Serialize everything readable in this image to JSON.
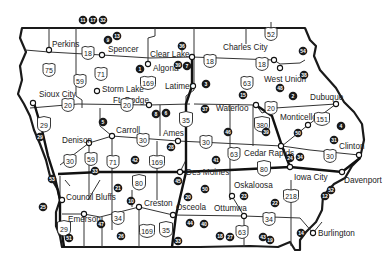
{
  "map": {
    "title": "Iowa",
    "cities": [
      {
        "name": "Perkins",
        "x": 49,
        "y": 50,
        "lx": 52,
        "ly": 47
      },
      {
        "name": "Spencer",
        "x": 102,
        "y": 55,
        "lx": 108,
        "ly": 52
      },
      {
        "name": "Clear Lake",
        "x": 192,
        "y": 57,
        "lx": 150,
        "ly": 57
      },
      {
        "name": "Algona",
        "x": 148,
        "y": 64,
        "lx": 153,
        "ly": 71
      },
      {
        "name": "Charles City",
        "x": 274,
        "y": 60,
        "lx": 223,
        "ly": 50
      },
      {
        "name": "Latimer",
        "x": 193,
        "y": 86,
        "lx": 165,
        "ly": 89
      },
      {
        "name": "West Union",
        "x": 280,
        "y": 68,
        "lx": 264,
        "ly": 82
      },
      {
        "name": "Storm Lake",
        "x": 97,
        "y": 91,
        "lx": 102,
        "ly": 92
      },
      {
        "name": "Sioux City",
        "x": 33,
        "y": 103,
        "lx": 39,
        "ly": 97
      },
      {
        "name": "Ft. Dodge",
        "x": 149,
        "y": 105,
        "lx": 113,
        "ly": 103
      },
      {
        "name": "Dubuque",
        "x": 336,
        "y": 104,
        "lx": 310,
        "ly": 100
      },
      {
        "name": "Waterloo",
        "x": 256,
        "y": 105,
        "lx": 216,
        "ly": 111
      },
      {
        "name": "Monticello",
        "x": 308,
        "y": 125,
        "lx": 280,
        "ly": 120
      },
      {
        "name": "Carroll",
        "x": 112,
        "y": 136,
        "lx": 116,
        "ly": 133
      },
      {
        "name": "Ames",
        "x": 178,
        "y": 141,
        "lx": 163,
        "ly": 136
      },
      {
        "name": "Denison",
        "x": 89,
        "y": 143,
        "lx": 62,
        "ly": 143
      },
      {
        "name": "Clinton",
        "x": 359,
        "y": 155,
        "lx": 339,
        "ly": 149
      },
      {
        "name": "Cedar Rapids",
        "x": 281,
        "y": 146,
        "lx": 244,
        "ly": 156
      },
      {
        "name": "Des Moines",
        "x": 180,
        "y": 172,
        "lx": 186,
        "ly": 175
      },
      {
        "name": "Iowa City",
        "x": 290,
        "y": 167,
        "lx": 294,
        "ly": 180
      },
      {
        "name": "Davenport",
        "x": 342,
        "y": 172,
        "lx": 344,
        "ly": 183
      },
      {
        "name": "Council Bluffs",
        "x": 62,
        "y": 200,
        "lx": 66,
        "ly": 200
      },
      {
        "name": "Oskaloosa",
        "x": 232,
        "y": 196,
        "lx": 234,
        "ly": 188
      },
      {
        "name": "Emerson",
        "x": 84,
        "y": 214,
        "lx": 68,
        "ly": 222
      },
      {
        "name": "Creston",
        "x": 139,
        "y": 207,
        "lx": 144,
        "ly": 206
      },
      {
        "name": "Osceola",
        "x": 173,
        "y": 215,
        "lx": 176,
        "ly": 210
      },
      {
        "name": "Ottumwa",
        "x": 244,
        "y": 216,
        "lx": 214,
        "ly": 211
      },
      {
        "name": "Burlington",
        "x": 313,
        "y": 233,
        "lx": 318,
        "ly": 236
      }
    ],
    "us_highways": [
      {
        "num": "18",
        "x": 88,
        "y": 52
      },
      {
        "num": "18",
        "x": 210,
        "y": 60
      },
      {
        "num": "18",
        "x": 262,
        "y": 63
      },
      {
        "num": "52",
        "x": 271,
        "y": 33
      },
      {
        "num": "75",
        "x": 49,
        "y": 69
      },
      {
        "num": "59",
        "x": 80,
        "y": 80
      },
      {
        "name": "71-north",
        "num": "71",
        "x": 101,
        "y": 73
      },
      {
        "num": "169",
        "x": 148,
        "y": 82
      },
      {
        "num": "63",
        "x": 247,
        "y": 82
      },
      {
        "num": "20",
        "x": 68,
        "y": 104
      },
      {
        "num": "20",
        "x": 127,
        "y": 104
      },
      {
        "num": "20",
        "x": 271,
        "y": 107
      },
      {
        "num": "151",
        "x": 322,
        "y": 118
      },
      {
        "num": "30",
        "x": 70,
        "y": 160
      },
      {
        "num": "59",
        "x": 91,
        "y": 158
      },
      {
        "num": "71",
        "x": 113,
        "y": 161
      },
      {
        "num": "30",
        "x": 143,
        "y": 139
      },
      {
        "num": "169",
        "x": 157,
        "y": 161
      },
      {
        "num": "30",
        "x": 206,
        "y": 141
      },
      {
        "num": "63",
        "x": 234,
        "y": 153
      },
      {
        "num": "30",
        "x": 330,
        "y": 155
      },
      {
        "num": "34",
        "x": 118,
        "y": 217
      },
      {
        "num": "169",
        "x": 147,
        "y": 230
      },
      {
        "num": "63",
        "x": 242,
        "y": 231
      },
      {
        "num": "34",
        "x": 269,
        "y": 218
      },
      {
        "num": "218",
        "x": 291,
        "y": 195
      }
    ],
    "interstates": [
      {
        "num": "29",
        "x": 44,
        "y": 124
      },
      {
        "num": "35",
        "x": 186,
        "y": 119
      },
      {
        "num": "380",
        "x": 262,
        "y": 124
      },
      {
        "num": "80",
        "x": 139,
        "y": 182
      },
      {
        "num": "80",
        "x": 264,
        "y": 168
      },
      {
        "num": "29",
        "x": 64,
        "y": 228
      },
      {
        "num": "35",
        "x": 166,
        "y": 229
      }
    ],
    "markers": [
      {
        "num": "11",
        "x": 83,
        "y": 20
      },
      {
        "num": "17",
        "x": 93,
        "y": 20
      },
      {
        "num": "32",
        "x": 103,
        "y": 20
      },
      {
        "num": "9",
        "x": 108,
        "y": 40
      },
      {
        "num": "13",
        "x": 117,
        "y": 36
      },
      {
        "num": "1",
        "x": 140,
        "y": 69
      },
      {
        "num": "36",
        "x": 182,
        "y": 46
      },
      {
        "num": "39",
        "x": 178,
        "y": 65
      },
      {
        "num": "7",
        "x": 187,
        "y": 66
      },
      {
        "num": "3",
        "x": 206,
        "y": 84
      },
      {
        "num": "54",
        "x": 303,
        "y": 51
      },
      {
        "num": "38",
        "x": 304,
        "y": 75
      },
      {
        "num": "15",
        "x": 243,
        "y": 95
      },
      {
        "num": "48",
        "x": 280,
        "y": 88
      },
      {
        "num": "2",
        "x": 293,
        "y": 96
      },
      {
        "num": "37",
        "x": 205,
        "y": 109
      },
      {
        "name": "marker-5",
        "num": "5",
        "x": 103,
        "y": 122
      },
      {
        "num": "8",
        "x": 156,
        "y": 114
      },
      {
        "num": "6",
        "x": 166,
        "y": 113
      },
      {
        "num": "39",
        "x": 266,
        "y": 132
      },
      {
        "num": "50",
        "x": 298,
        "y": 133
      },
      {
        "num": "4",
        "x": 341,
        "y": 126
      },
      {
        "num": "31",
        "x": 334,
        "y": 140
      },
      {
        "num": "46",
        "x": 228,
        "y": 132
      },
      {
        "num": "28",
        "x": 171,
        "y": 147
      },
      {
        "num": "29",
        "x": 40,
        "y": 137
      },
      {
        "num": "42",
        "x": 135,
        "y": 160
      },
      {
        "num": "41",
        "x": 216,
        "y": 160
      },
      {
        "num": "33",
        "x": 95,
        "y": 171
      },
      {
        "name": "marker-53",
        "num": "53",
        "x": 52,
        "y": 179
      },
      {
        "num": "24",
        "x": 290,
        "y": 158
      },
      {
        "num": "34",
        "x": 300,
        "y": 157
      },
      {
        "num": "45",
        "x": 178,
        "y": 181
      },
      {
        "num": "21",
        "x": 118,
        "y": 188
      },
      {
        "num": "25",
        "x": 43,
        "y": 207
      },
      {
        "num": "52",
        "x": 331,
        "y": 190
      },
      {
        "num": "12",
        "x": 325,
        "y": 196
      },
      {
        "num": "20",
        "x": 188,
        "y": 197
      },
      {
        "num": "50",
        "x": 205,
        "y": 189
      },
      {
        "num": "23",
        "x": 244,
        "y": 196
      },
      {
        "num": "22",
        "x": 275,
        "y": 203
      },
      {
        "num": "47",
        "x": 101,
        "y": 224
      },
      {
        "num": "10",
        "x": 131,
        "y": 201
      },
      {
        "num": "26",
        "x": 121,
        "y": 236
      },
      {
        "num": "51",
        "x": 69,
        "y": 238
      },
      {
        "num": "44",
        "x": 190,
        "y": 223
      },
      {
        "num": "40",
        "x": 204,
        "y": 224
      },
      {
        "num": "33",
        "x": 178,
        "y": 241
      },
      {
        "num": "18",
        "x": 220,
        "y": 236
      },
      {
        "num": "27",
        "x": 230,
        "y": 237
      },
      {
        "num": "43",
        "x": 263,
        "y": 237
      },
      {
        "num": "19",
        "x": 270,
        "y": 240
      },
      {
        "num": "14",
        "x": 301,
        "y": 233
      }
    ]
  }
}
